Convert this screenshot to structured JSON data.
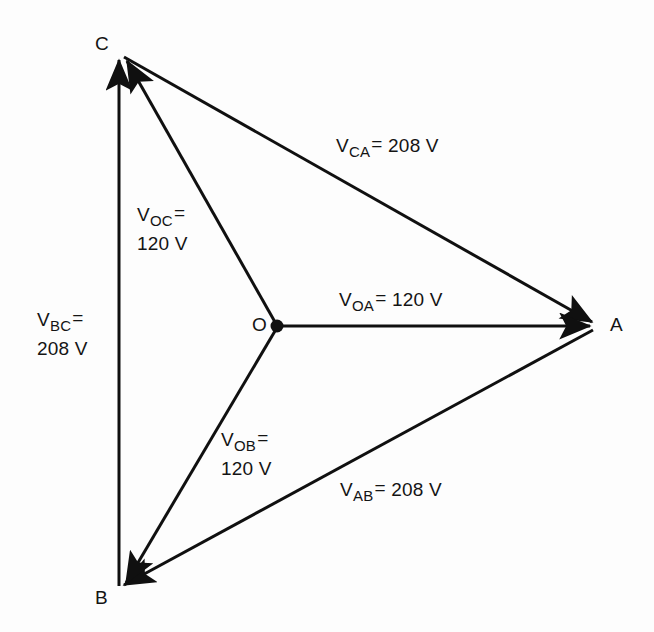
{
  "diagram": {
    "type": "phasor-diagram",
    "stroke_color": "#101010",
    "background_color": "#fdfdfd",
    "vertices": [
      {
        "id": "C",
        "label": "C",
        "x": 120,
        "y": 53
      },
      {
        "id": "A",
        "label": "A",
        "x": 597,
        "y": 325
      },
      {
        "id": "B",
        "label": "B",
        "x": 118,
        "y": 590
      },
      {
        "id": "O",
        "label": "O",
        "x": 277,
        "y": 326,
        "neutral": true
      }
    ],
    "phasors": [
      {
        "id": "VOA",
        "from": "O",
        "to": "A",
        "magnitude": 120,
        "unit": "V",
        "label_main": "V",
        "label_sub": "OA",
        "label_eq": "=",
        "label_value": "120 V",
        "label_text": "V_OA = 120 V",
        "single_line": true
      },
      {
        "id": "VOB",
        "from": "O",
        "to": "B",
        "magnitude": 120,
        "unit": "V",
        "label_main": "V",
        "label_sub": "OB",
        "label_eq": "=",
        "label_value": "120 V",
        "label_text": "V_OB = 120 V",
        "single_line": false
      },
      {
        "id": "VOC",
        "from": "O",
        "to": "C",
        "magnitude": 120,
        "unit": "V",
        "label_main": "V",
        "label_sub": "OC",
        "label_eq": "=",
        "label_value": "120 V",
        "label_text": "V_OC = 120 V",
        "single_line": false
      },
      {
        "id": "VAB",
        "from": "A",
        "to": "B",
        "magnitude": 208,
        "unit": "V",
        "label_main": "V",
        "label_sub": "AB",
        "label_eq": "=",
        "label_value": "208 V",
        "label_text": "V_AB = 208 V",
        "single_line": true
      },
      {
        "id": "VBC",
        "from": "B",
        "to": "C",
        "magnitude": 208,
        "unit": "V",
        "label_main": "V",
        "label_sub": "BC",
        "label_eq": "=",
        "label_value": "208 V",
        "label_text": "V_BC = 208 V",
        "single_line": false
      },
      {
        "id": "VCA",
        "from": "C",
        "to": "A",
        "magnitude": 208,
        "unit": "V",
        "label_main": "V",
        "label_sub": "CA",
        "label_eq": "=",
        "label_value": "208 V",
        "label_text": "V_CA = 208 V",
        "single_line": true
      }
    ]
  }
}
